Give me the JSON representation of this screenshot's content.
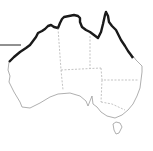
{
  "map": {
    "subject": "Australia outline",
    "highlight": "northern coastline",
    "colors": {
      "background": "#ffffff",
      "coast": "#9a9a9a",
      "highlight": "#1a1a1a",
      "borders": "#9a9a9a",
      "pointer": "#222222"
    },
    "regions": [
      "Western Australia",
      "Northern Territory",
      "South Australia",
      "Queensland",
      "New South Wales",
      "Victoria",
      "Tasmania"
    ]
  }
}
